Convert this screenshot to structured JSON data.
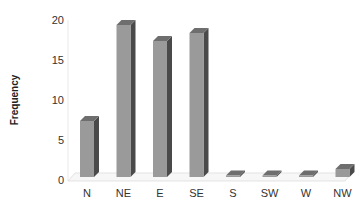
{
  "chart_data": {
    "type": "bar",
    "title": "",
    "xlabel": "",
    "ylabel": "Frequency",
    "categories": [
      "N",
      "NE",
      "E",
      "SE",
      "S",
      "SW",
      "W",
      "NW"
    ],
    "values": [
      7,
      19,
      17,
      18,
      0,
      0,
      0,
      1
    ],
    "ylim": [
      0,
      20
    ],
    "yticks": [
      0,
      5,
      10,
      15,
      20
    ],
    "grid": false,
    "legend": null,
    "style": "3d-column",
    "colors": {
      "front": "#9a9a9a",
      "side": "#4a4a4a",
      "top": "#6e6e6e",
      "floor": "#d8d8d8"
    }
  }
}
